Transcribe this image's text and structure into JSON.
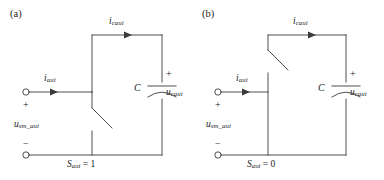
{
  "figure": {
    "background": "#ffffff",
    "line_color": "#3a3a3a",
    "text_color": "#1a1a1a"
  },
  "panels": [
    {
      "tag": "(a)",
      "input_current": {
        "symbol": "i",
        "subscript": "aui"
      },
      "cap_current": {
        "symbol": "i",
        "subscript": "caui"
      },
      "source_voltage": {
        "symbol": "u",
        "subscript": "sm_aui"
      },
      "cap_voltage": {
        "symbol": "u",
        "subscript": "caui"
      },
      "cap_label": "C",
      "plus_terminal": "+",
      "minus_terminal": "−",
      "cap_plus": "+",
      "switch_state": {
        "symbol": "S",
        "subscript": "aui",
        "equals": "=",
        "value": "1"
      },
      "switch_position": "lower-branch"
    },
    {
      "tag": "(b)",
      "input_current": {
        "symbol": "i",
        "subscript": "aui"
      },
      "cap_current": {
        "symbol": "i",
        "subscript": "caui"
      },
      "source_voltage": {
        "symbol": "u",
        "subscript": "sm_aui"
      },
      "cap_voltage": {
        "symbol": "u",
        "subscript": "caui"
      },
      "cap_label": "C",
      "plus_terminal": "+",
      "minus_terminal": "−",
      "cap_plus": "+",
      "switch_state": {
        "symbol": "S",
        "subscript": "aui",
        "equals": "=",
        "value": "0"
      },
      "switch_position": "upper-branch"
    }
  ]
}
